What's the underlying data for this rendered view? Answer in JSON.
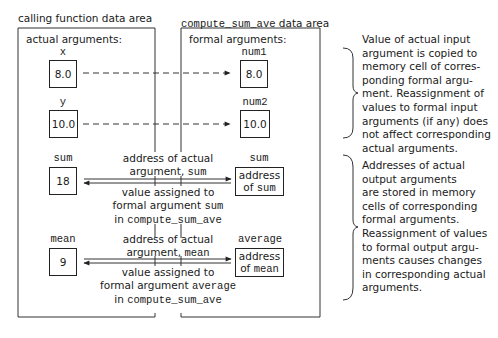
{
  "left_panel": {
    "title": "calling function data area",
    "subtitle": "actual arguments:"
  },
  "right_panel": {
    "title_code": "compute_sum_ave",
    "title_rest": " data area",
    "subtitle": "formal arguments:"
  },
  "rows": {
    "x": {
      "actual_name": "x",
      "actual_value": "8.0",
      "formal_name": "num1",
      "formal_value": "8.0"
    },
    "y": {
      "actual_name": "y",
      "actual_value": "10.0",
      "formal_name": "num2",
      "formal_value": "10.0"
    },
    "sum": {
      "actual_name": "sum",
      "actual_value": "18",
      "formal_name": "sum",
      "formal_line1": "address",
      "formal_line2_text": "of ",
      "formal_line2_code": "sum",
      "top_label_line1": "address of actual",
      "top_label_line2_text": "argument, ",
      "top_label_line2_code": "sum",
      "bottom_label_line1": "value assigned to",
      "bottom_label_line2_text": "formal argument ",
      "bottom_label_line2_code": "sum",
      "bottom_label_line3_text": "in ",
      "bottom_label_line3_code": "compute_sum_ave"
    },
    "mean": {
      "actual_name": "mean",
      "actual_value": "9",
      "formal_name": "average",
      "formal_line1": "address",
      "formal_line2_text": "of ",
      "formal_line2_code": "mean",
      "top_label_line1": "address of actual",
      "top_label_line2_text": "argument, ",
      "top_label_line2_code": "mean",
      "bottom_label_line1": "value assigned to",
      "bottom_label_line2_text": "formal argument ",
      "bottom_label_line2_code": "average",
      "bottom_label_line3_text": "in ",
      "bottom_label_line3_code": "compute_sum_ave"
    }
  },
  "notes": {
    "input": [
      "Value of actual input",
      "argument is copied to",
      "memory cell of corres-",
      "ponding formal argu-",
      "ment. Reassignment of",
      "values to formal input",
      "arguments (if any) does",
      "not affect corresponding",
      "actual arguments."
    ],
    "output": [
      "Addresses of actual",
      "output arguments",
      "are stored in memory",
      "cells of corresponding",
      "formal arguments.",
      "Reassignment of values",
      "to formal output argu-",
      "ments causes changes",
      "in corresponding actual",
      "arguments."
    ]
  },
  "colors": {
    "line": "#222222",
    "text": "#1a1a1a",
    "background": "#ffffff"
  }
}
